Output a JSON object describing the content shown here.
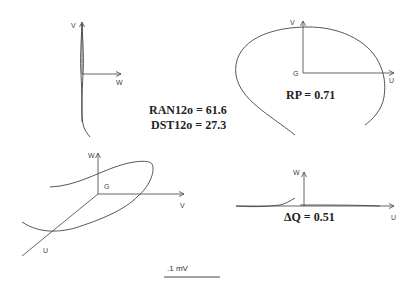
{
  "figure": {
    "panels": [
      {
        "id": "frontal",
        "axes": {
          "vertical": "V",
          "horizontal": "W"
        }
      },
      {
        "id": "transverse",
        "axes": {
          "vertical": "V",
          "horizontal": "U",
          "origin": "G"
        },
        "stat": "RP = 0.71"
      },
      {
        "id": "spatial",
        "axes": {
          "vertical": "W",
          "horizontal": "V",
          "diagonal": "U",
          "origin": "G"
        }
      },
      {
        "id": "sagittal",
        "axes": {
          "vertical": "W",
          "horizontal": "U"
        },
        "stat": "ΔQ = 0.51"
      }
    ],
    "center_stats": {
      "line1": "RAN12o = 61.6",
      "line2": "DST12o = 27.3"
    },
    "scale_bar": {
      "label": ".1 mV"
    }
  }
}
